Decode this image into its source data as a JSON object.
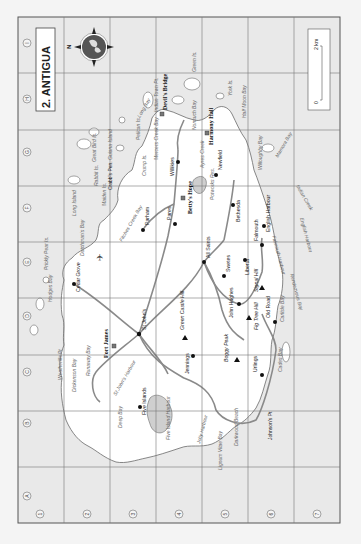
{
  "title": "2. ANTIGUA",
  "compass": {
    "north_label": "N"
  },
  "scale": {
    "zero": "0",
    "max": "2 km"
  },
  "grid": {
    "columns": [
      "A",
      "B",
      "C",
      "D",
      "E",
      "F",
      "G",
      "H",
      "I"
    ],
    "rows": [
      "1",
      "2",
      "3",
      "4",
      "5",
      "6",
      "7"
    ]
  },
  "towns": [
    {
      "name": "St John's"
    },
    {
      "name": "Cedar Grove"
    },
    {
      "name": "Parham"
    },
    {
      "name": "Pares"
    },
    {
      "name": "Willikies"
    },
    {
      "name": "Newfield"
    },
    {
      "name": "Bethesda"
    },
    {
      "name": "English Harbour"
    },
    {
      "name": "Falmouth"
    },
    {
      "name": "Liberta"
    },
    {
      "name": "Swetes"
    },
    {
      "name": "All Saints"
    },
    {
      "name": "John Hughes"
    },
    {
      "name": "Old Road"
    },
    {
      "name": "Urlings"
    },
    {
      "name": "Jennings"
    },
    {
      "name": "Five Islands"
    }
  ],
  "sites": [
    {
      "name": "Fort James"
    },
    {
      "name": "Betty's Hope"
    },
    {
      "name": "Devil's Bridge"
    },
    {
      "name": "Harmony Hall"
    }
  ],
  "peaks": [
    {
      "name": "Green Castle Hill"
    },
    {
      "name": "Boggy Peak"
    },
    {
      "name": "Fig Tree Hill"
    },
    {
      "name": "Signal Hill"
    }
  ],
  "water_labels": {
    "weatherills_pt": "Weatherills Pt",
    "dickenson_bay": "Dickenson Bay",
    "runaway_bay": "Runaway Bay",
    "st_johns_harbour": "St John's Harbour",
    "deep_bay": "Deep Bay",
    "five_island_harbour": "Five Island Harbour",
    "jolly_harbour": "Jolly Harbour",
    "lignum_vitae_bay": "Lignum Vitae Bay",
    "darkwood_beach": "Darkwood Beach",
    "johnsons_pt": "Johnson's Pt",
    "cades_bay": "Cades Bay",
    "carlisle_bay": "Carlisle Bay",
    "rendezvous_bay": "Rendezvous Bay",
    "falmouth_harbour": "Falmouth Harbour",
    "english_harbour_w": "English Harbour",
    "indian_creek": "Indian Creek",
    "mamora_bay": "Mamora Bay",
    "willoughby_bay": "Willoughby Bay",
    "half_moon_bay": "Half Moon Bay",
    "york_is": "York Is.",
    "green_is": "Green Is.",
    "nonsuch_bay": "Nonsuch Bay",
    "indian_town_pt": "Indian Town Pt.",
    "long_bay": "Long Bay",
    "pelican_is": "Pelican Is.",
    "mercers_creek_bay": "Mercers Creek Bay",
    "crump_is": "Crump Is.",
    "guiana_island": "Guiana Island",
    "great_bird_is": "Great Bird Is.",
    "maiden_is": "Maiden Is.",
    "rabbit_is": "Rabbit Is.",
    "crabs_pen": "Crabb's Pen.",
    "long_island": "Long Island",
    "dutchmans_bay": "Dutchman's Bay",
    "prickly_pear_is": "Prickly Pear Is.",
    "hodges_bay": "Hodges Bay",
    "fitches_creek_bay": "Fitches Creek Bay",
    "potworks_res": "Potworks Res.",
    "ayres_creek": "Ayres Creek"
  }
}
